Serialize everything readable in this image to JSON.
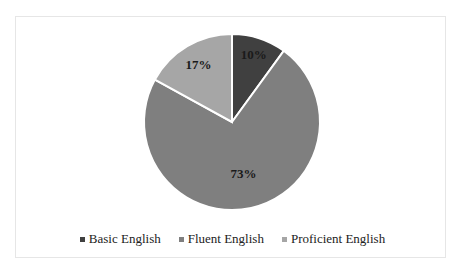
{
  "chart_data": {
    "type": "pie",
    "title": "",
    "categories": [
      "Basic English",
      "Fluent English",
      "Proficient English"
    ],
    "values": [
      10,
      73,
      17
    ],
    "labels": [
      "10%",
      "73%",
      "17%"
    ],
    "colors": [
      "#404040",
      "#7f7f7f",
      "#a6a6a6"
    ],
    "legend_position": "bottom",
    "start_angle_deg": 0,
    "direction": "clockwise"
  },
  "legend": [
    {
      "label": "Basic English",
      "color": "#404040"
    },
    {
      "label": "Fluent English",
      "color": "#7f7f7f"
    },
    {
      "label": "Proficient English",
      "color": "#a6a6a6"
    }
  ]
}
